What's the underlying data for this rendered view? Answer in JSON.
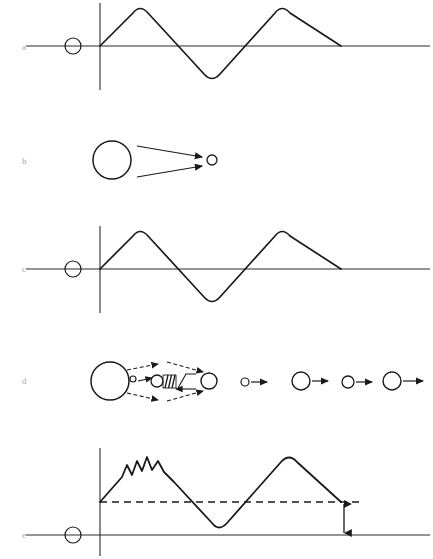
{
  "figure": {
    "background_color": "#ffffff",
    "stroke_color": "#1a1a1a",
    "axis_color": "#2b2b2b",
    "label_color": "#a8a8a8",
    "width": 433,
    "height": 559
  },
  "panels": [
    {
      "id": "a",
      "label": "a",
      "label_x": 22,
      "label_y": 50,
      "type": "waveform",
      "baseline_y": 46,
      "axis_x": 100,
      "axis_top": 3,
      "axis_bottom": 90,
      "baseline_x1": 26,
      "baseline_x2": 430,
      "marker_circle": {
        "cx": 73,
        "cy": 46,
        "r": 8
      },
      "wave_path": "M100,46 L133,13 Q140,4 148,13 L204,74 Q212,83 220,74 L275,13 Q282,4 290,13 L341,46",
      "description": "Sinusoid-like wave: one positive lobe, one negative lobe, one positive lobe, returning to baseline"
    },
    {
      "id": "b",
      "label": "b",
      "label_x": 22,
      "label_y": 164,
      "type": "emission",
      "source_circle": {
        "cx": 112,
        "cy": 160,
        "r": 19
      },
      "target_circle": {
        "cx": 212,
        "cy": 160,
        "r": 5
      },
      "arrows": [
        {
          "x1": 137,
          "y1": 146,
          "x2": 203,
          "y2": 157
        },
        {
          "x1": 137,
          "y1": 176,
          "x2": 203,
          "y2": 165
        }
      ],
      "arrow_style": "solid",
      "description": "Large source circle emitting two converging arrows toward a small circle"
    },
    {
      "id": "c",
      "label": "c",
      "label_x": 22,
      "label_y": 272,
      "type": "waveform",
      "baseline_y": 269,
      "axis_x": 100,
      "axis_top": 226,
      "axis_bottom": 313,
      "baseline_x1": 26,
      "baseline_x2": 430,
      "marker_circle": {
        "cx": 73,
        "cy": 269,
        "r": 8
      },
      "wave_path": "M100,269 L133,236 Q140,227 148,236 L204,297 Q212,306 220,297 L275,236 Q282,227 290,236 L341,269",
      "description": "Identical waveform to panel a"
    },
    {
      "id": "d",
      "label": "d",
      "label_x": 22,
      "label_y": 384,
      "type": "emission-sequence",
      "source_circle": {
        "cx": 110,
        "cy": 381,
        "r": 19
      },
      "dashed_arrows": [
        {
          "x1": 128,
          "y1": 369,
          "x2": 160,
          "y2": 364
        },
        {
          "x1": 128,
          "y1": 393,
          "x2": 160,
          "y2": 399
        },
        {
          "x1": 166,
          "y1": 363,
          "x2": 204,
          "y2": 371
        },
        {
          "x1": 166,
          "y1": 400,
          "x2": 204,
          "y2": 392
        }
      ],
      "solid_arrows": [
        {
          "x1": 140,
          "y1": 380,
          "x2": 158,
          "y2": 377
        },
        {
          "x1": 172,
          "y1": 388,
          "x2": 196,
          "y2": 388
        }
      ],
      "small_particle": {
        "cx": 133,
        "cy": 379,
        "r": 3
      },
      "mid_circle": {
        "cx": 156,
        "cy": 381,
        "r": 6
      },
      "hatch_block": {
        "x": 163,
        "y": 374,
        "w": 13,
        "h": 14,
        "lines": 4
      },
      "end_circle": {
        "cx": 208,
        "cy": 381,
        "r": 8
      },
      "sequence": [
        {
          "cx": 244,
          "cy": 382,
          "r": 4,
          "arrow_x1": 250,
          "arrow_y": 382,
          "arrow_x2": 268
        },
        {
          "cx": 301,
          "cy": 381,
          "r": 9,
          "arrow_x1": 312,
          "arrow_y": 381,
          "arrow_x2": 330
        },
        {
          "cx": 347,
          "cy": 382,
          "r": 6,
          "arrow_x1": 355,
          "arrow_y": 382,
          "arrow_x2": 373
        },
        {
          "cx": 392,
          "cy": 381,
          "r": 9,
          "arrow_x1": 403,
          "arrow_y": 381,
          "arrow_x2": 424
        }
      ],
      "description": "Source circle emits particle through hatched region; then a row of four circles each with a rightward arrow"
    },
    {
      "id": "e",
      "label": "e",
      "label_x": 22,
      "label_y": 538,
      "type": "waveform-offset",
      "baseline_y": 535,
      "axis_x": 100,
      "axis_top": 448,
      "axis_bottom": 556,
      "baseline_x1": 26,
      "baseline_x2": 430,
      "marker_circle": {
        "cx": 73,
        "cy": 535,
        "r": 8
      },
      "offset_y": 502,
      "dashed_line": {
        "x1": 100,
        "y1": 502,
        "x2": 362,
        "y2": 502
      },
      "measure_arrow": {
        "x": 344,
        "y_top": 503,
        "y_bottom": 534
      },
      "wave_path": "M100,502 L122,477 L127,465 L132,474 L137,461 L142,470 L147,457 L152,469 L157,462 L163,470 L174,481 L212,523 Q219,532 227,523 L281,462 Q289,453 297,462 L341,502",
      "ripple_count": 3,
      "description": "Waveform offset above baseline with small ripples on rising edge; dashed reference line and double-headed arrow indicating offset magnitude"
    }
  ],
  "caption": {
    "text": "",
    "visible": false
  }
}
